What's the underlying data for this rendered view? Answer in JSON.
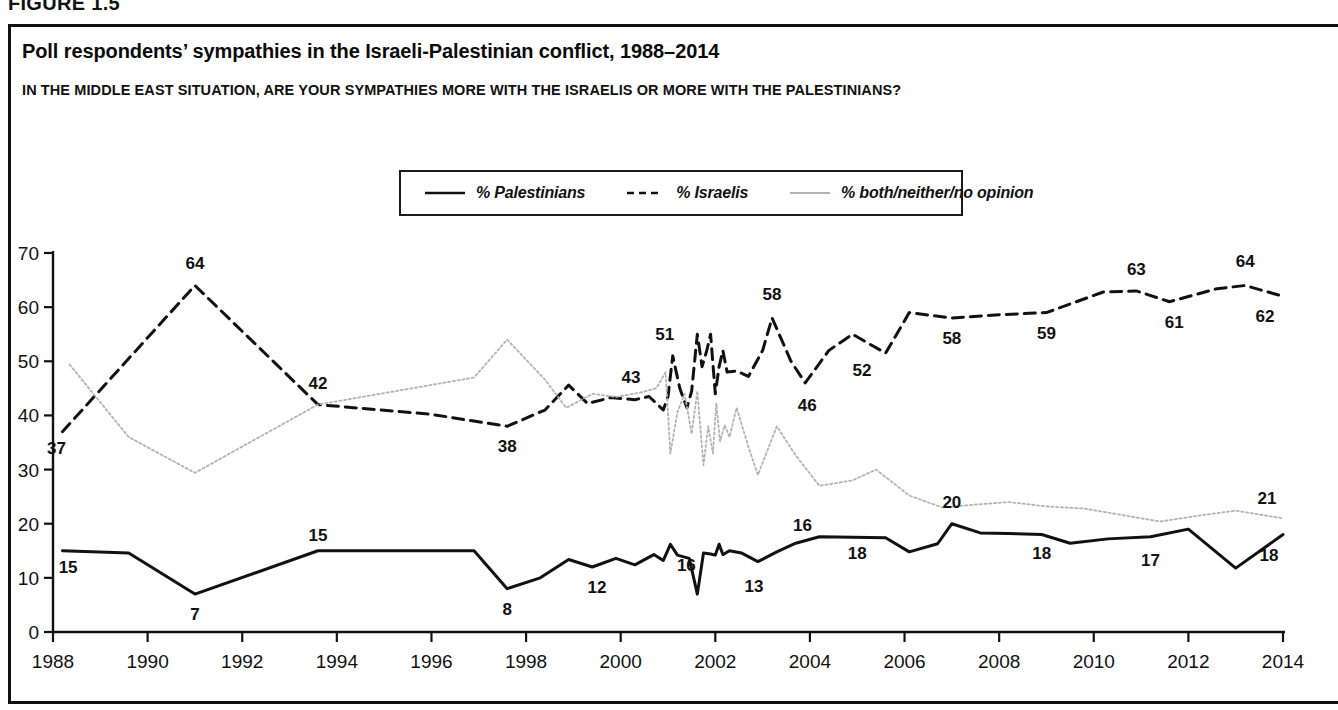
{
  "figure": {
    "number_label": "FIGURE 1.5"
  },
  "header": {
    "title": "Poll respondents’ sympathies in the Israeli-Palestinian conflict, 1988–2014",
    "subtitle": "IN THE MIDDLE EAST SITUATION, ARE YOUR SYMPATHIES MORE WITH THE ISRAELIS OR MORE WITH THE PALESTINIANS?"
  },
  "legend": {
    "position": "top-center",
    "entries": [
      {
        "label": "% Palestinians",
        "style": "solid",
        "color": "#111111"
      },
      {
        "label": "% Israelis",
        "style": "dashed",
        "color": "#111111"
      },
      {
        "label": "% both/neither/no opinion",
        "style": "dotted",
        "color": "#b3b3b3"
      }
    ]
  },
  "chart_data": {
    "type": "line",
    "title": "Poll respondents’ sympathies in the Israeli-Palestinian conflict, 1988–2014",
    "subtitle": "IN THE MIDDLE EAST SITUATION, ARE YOUR SYMPATHIES MORE WITH THE ISRAELIS OR MORE WITH THE PALESTINIANS?",
    "xlabel": "",
    "ylabel": "",
    "xlim": [
      1988,
      2014
    ],
    "ylim": [
      0,
      70
    ],
    "ytick_labels": [
      "0",
      "10",
      "20",
      "30",
      "40",
      "50",
      "60",
      "70"
    ],
    "yticks": [
      0,
      10,
      20,
      30,
      40,
      50,
      60,
      70
    ],
    "xtick_labels": [
      "1988",
      "1990",
      "1992",
      "1994",
      "1996",
      "1998",
      "2000",
      "2002",
      "2004",
      "2006",
      "2008",
      "2010",
      "2012",
      "2014"
    ],
    "xticks": [
      1988,
      1990,
      1992,
      1994,
      1996,
      1998,
      2000,
      2002,
      2004,
      2006,
      2008,
      2010,
      2012,
      2014
    ],
    "grid": false,
    "legend_position": "top-center",
    "series": [
      {
        "name": "% Palestinians",
        "style": "solid",
        "color": "#111111",
        "points": [
          [
            1988.2,
            15
          ],
          [
            1989.6,
            14.6
          ],
          [
            1991.0,
            7
          ],
          [
            1993.6,
            15
          ],
          [
            1996.9,
            15
          ],
          [
            1997.6,
            8
          ],
          [
            1998.3,
            10
          ],
          [
            1998.9,
            13.4
          ],
          [
            1999.4,
            12
          ],
          [
            1999.9,
            13.6
          ],
          [
            2000.3,
            12.4
          ],
          [
            2000.7,
            14.3
          ],
          [
            2000.9,
            13.2
          ],
          [
            2001.05,
            16.2
          ],
          [
            2001.2,
            14.2
          ],
          [
            2001.45,
            13.6
          ],
          [
            2001.62,
            7
          ],
          [
            2001.75,
            14.6
          ],
          [
            2001.9,
            14.4
          ],
          [
            2002.0,
            14.2
          ],
          [
            2002.08,
            16.2
          ],
          [
            2002.16,
            14.3
          ],
          [
            2002.3,
            15.0
          ],
          [
            2002.55,
            14.6
          ],
          [
            2002.9,
            13
          ],
          [
            2003.3,
            14.8
          ],
          [
            2003.7,
            16.4
          ],
          [
            2004.2,
            17.6
          ],
          [
            2004.9,
            17.5
          ],
          [
            2005.6,
            17.4
          ],
          [
            2006.1,
            14.8
          ],
          [
            2006.7,
            16.3
          ],
          [
            2007.0,
            20
          ],
          [
            2007.6,
            18.3
          ],
          [
            2008.2,
            18.2
          ],
          [
            2008.9,
            18
          ],
          [
            2009.5,
            16.4
          ],
          [
            2010.3,
            17.2
          ],
          [
            2011.2,
            17.6
          ],
          [
            2012.0,
            19
          ],
          [
            2013.0,
            11.8
          ],
          [
            2014.0,
            18
          ]
        ]
      },
      {
        "name": "% Israelis",
        "style": "dashed",
        "color": "#111111",
        "points": [
          [
            1988.2,
            37
          ],
          [
            1991.0,
            64
          ],
          [
            1993.6,
            42
          ],
          [
            1996.0,
            40.2
          ],
          [
            1997.6,
            38
          ],
          [
            1998.4,
            41.0
          ],
          [
            1998.9,
            45.6
          ],
          [
            1999.3,
            42.2
          ],
          [
            1999.8,
            43.3
          ],
          [
            2000.3,
            42.9
          ],
          [
            2000.6,
            43.5
          ],
          [
            2000.9,
            41.0
          ],
          [
            2001.0,
            43.5
          ],
          [
            2001.1,
            51
          ],
          [
            2001.25,
            45.0
          ],
          [
            2001.4,
            41.4
          ],
          [
            2001.5,
            44.5
          ],
          [
            2001.62,
            55
          ],
          [
            2001.72,
            49.0
          ],
          [
            2001.82,
            52.0
          ],
          [
            2001.9,
            55.0
          ],
          [
            2002.0,
            44.0
          ],
          [
            2002.08,
            49.0
          ],
          [
            2002.16,
            52.0
          ],
          [
            2002.25,
            48.0
          ],
          [
            2002.45,
            48.2
          ],
          [
            2002.7,
            47.2
          ],
          [
            2003.0,
            52.0
          ],
          [
            2003.2,
            58
          ],
          [
            2003.6,
            50.0
          ],
          [
            2003.9,
            46
          ],
          [
            2004.4,
            52.0
          ],
          [
            2004.9,
            55.0
          ],
          [
            2005.6,
            51.5
          ],
          [
            2006.1,
            59
          ],
          [
            2007.0,
            58
          ],
          [
            2008.0,
            58.6
          ],
          [
            2009.0,
            59
          ],
          [
            2010.2,
            62.8
          ],
          [
            2010.9,
            63
          ],
          [
            2011.6,
            61
          ],
          [
            2012.6,
            63.4
          ],
          [
            2013.2,
            64
          ],
          [
            2014.0,
            62
          ]
        ]
      },
      {
        "name": "% both/neither/no opinion",
        "style": "dotted",
        "color": "#b3b3b3",
        "points": [
          [
            1988.35,
            49.4
          ],
          [
            1989.6,
            36.0
          ],
          [
            1991.0,
            29.4
          ],
          [
            1993.6,
            42.0
          ],
          [
            1996.9,
            47.0
          ],
          [
            1997.6,
            54
          ],
          [
            1998.4,
            46.6
          ],
          [
            1998.85,
            41.4
          ],
          [
            1999.4,
            44.0
          ],
          [
            1999.9,
            43.4
          ],
          [
            2000.4,
            44.2
          ],
          [
            2000.75,
            45.0
          ],
          [
            2000.95,
            48.0
          ],
          [
            2001.05,
            33.0
          ],
          [
            2001.2,
            40.6
          ],
          [
            2001.35,
            44.0
          ],
          [
            2001.5,
            36.6
          ],
          [
            2001.62,
            44.5
          ],
          [
            2001.75,
            30.8
          ],
          [
            2001.85,
            38.0
          ],
          [
            2001.95,
            33.0
          ],
          [
            2002.02,
            42.2
          ],
          [
            2002.1,
            35.2
          ],
          [
            2002.2,
            38.2
          ],
          [
            2002.3,
            36.0
          ],
          [
            2002.45,
            41.4
          ],
          [
            2002.7,
            34.2
          ],
          [
            2002.9,
            29.0
          ],
          [
            2003.3,
            38.0
          ],
          [
            2003.7,
            32.6
          ],
          [
            2004.2,
            27.0
          ],
          [
            2004.9,
            28.0
          ],
          [
            2005.4,
            30.0
          ],
          [
            2006.1,
            25.2
          ],
          [
            2006.8,
            23.0
          ],
          [
            2007.6,
            23.6
          ],
          [
            2008.2,
            24.0
          ],
          [
            2009.0,
            23.2
          ],
          [
            2009.8,
            22.8
          ],
          [
            2010.6,
            21.6
          ],
          [
            2011.4,
            20.4
          ],
          [
            2012.3,
            21.6
          ],
          [
            2013.0,
            22.4
          ],
          [
            2014.0,
            21
          ]
        ]
      }
    ],
    "annotations": [
      {
        "text": "15",
        "x": 1988.15,
        "y": 15,
        "series": "% Palestinians"
      },
      {
        "text": "7",
        "x": 1991.0,
        "y": 7,
        "series": "% Palestinians"
      },
      {
        "text": "15",
        "x": 1993.6,
        "y": 15,
        "series": "% Palestinians"
      },
      {
        "text": "8",
        "x": 1997.6,
        "y": 8,
        "series": "% Palestinians"
      },
      {
        "text": "12",
        "x": 1999.5,
        "y": 12,
        "series": "% Palestinians"
      },
      {
        "text": "16",
        "x": 2001.05,
        "y": 16,
        "series": "% Palestinians"
      },
      {
        "text": "13",
        "x": 2002.9,
        "y": 13,
        "series": "% Palestinians"
      },
      {
        "text": "16",
        "x": 2003.8,
        "y": 16,
        "series": "% Palestinians"
      },
      {
        "text": "18",
        "x": 2005.0,
        "y": 18,
        "series": "% Palestinians"
      },
      {
        "text": "20",
        "x": 2007.0,
        "y": 20,
        "series": "% Palestinians"
      },
      {
        "text": "18",
        "x": 2008.9,
        "y": 18,
        "series": "% Palestinians"
      },
      {
        "text": "17",
        "x": 2011.2,
        "y": 17,
        "series": "% Palestinians"
      },
      {
        "text": "18",
        "x": 2014.0,
        "y": 18,
        "series": "% Palestinians"
      },
      {
        "text": "37",
        "x": 1988.2,
        "y": 37,
        "series": "% Israelis"
      },
      {
        "text": "64",
        "x": 1991.0,
        "y": 64,
        "series": "% Israelis"
      },
      {
        "text": "42",
        "x": 1993.6,
        "y": 42,
        "series": "% Israelis"
      },
      {
        "text": "38",
        "x": 1997.6,
        "y": 38,
        "series": "% Israelis"
      },
      {
        "text": "43",
        "x": 2000.3,
        "y": 43,
        "series": "% Israelis"
      },
      {
        "text": "51",
        "x": 2001.1,
        "y": 51,
        "series": "% Israelis"
      },
      {
        "text": "58",
        "x": 2003.2,
        "y": 58,
        "series": "% Israelis"
      },
      {
        "text": "46",
        "x": 2003.9,
        "y": 46,
        "series": "% Israelis"
      },
      {
        "text": "52",
        "x": 2005.1,
        "y": 52,
        "series": "% Israelis"
      },
      {
        "text": "58",
        "x": 2007.0,
        "y": 58,
        "series": "% Israelis"
      },
      {
        "text": "59",
        "x": 2009.0,
        "y": 59,
        "series": "% Israelis"
      },
      {
        "text": "63",
        "x": 2010.9,
        "y": 63,
        "series": "% Israelis"
      },
      {
        "text": "61",
        "x": 2011.7,
        "y": 61,
        "series": "% Israelis"
      },
      {
        "text": "64",
        "x": 2013.2,
        "y": 64,
        "series": "% Israelis"
      },
      {
        "text": "62",
        "x": 2014.0,
        "y": 62,
        "series": "% Israelis"
      },
      {
        "text": "21",
        "x": 2014.0,
        "y": 21,
        "series": "% both/neither/no opinion"
      }
    ]
  }
}
